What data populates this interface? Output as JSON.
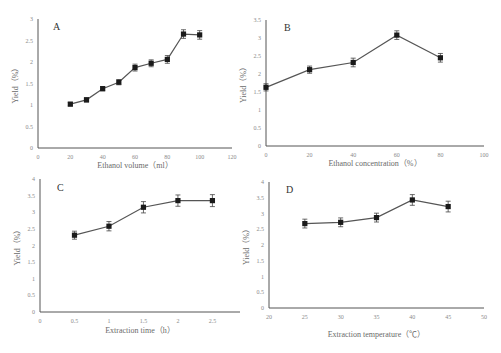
{
  "chart_data": [
    {
      "panel": "A",
      "type": "line",
      "title": "",
      "xlabel": "Ethanol volume（ml）",
      "ylabel": "Yield（%）",
      "x": [
        20,
        30,
        40,
        50,
        60,
        70,
        80,
        90,
        100
      ],
      "values": [
        1.02,
        1.12,
        1.38,
        1.53,
        1.87,
        1.97,
        2.06,
        2.65,
        2.63
      ],
      "errors": [
        0.04,
        0.05,
        0.05,
        0.06,
        0.08,
        0.08,
        0.09,
        0.1,
        0.1
      ],
      "xlim": [
        0,
        120
      ],
      "xticks": [
        0,
        20,
        40,
        60,
        80,
        100,
        120
      ],
      "ylim": [
        0,
        3
      ],
      "yticks": [
        0,
        0.5,
        1,
        1.5,
        2,
        2.5,
        3
      ],
      "grid": false,
      "legend": "none"
    },
    {
      "panel": "B",
      "type": "line",
      "title": "",
      "xlabel": "Ethanol concentration（%）",
      "ylabel": "Yield（%）",
      "x": [
        0,
        20,
        40,
        60,
        80
      ],
      "values": [
        1.63,
        2.12,
        2.32,
        3.08,
        2.45
      ],
      "errors": [
        0.1,
        0.1,
        0.12,
        0.12,
        0.12
      ],
      "xlim": [
        0,
        100
      ],
      "xticks": [
        0,
        20,
        40,
        60,
        80,
        100
      ],
      "ylim": [
        0,
        3.5
      ],
      "yticks": [
        0,
        0.5,
        1,
        1.5,
        2,
        2.5,
        3,
        3.5
      ],
      "grid": false,
      "legend": "none"
    },
    {
      "panel": "C",
      "type": "line",
      "title": "",
      "xlabel": "Extraction time（h）",
      "ylabel": "Yield（%）",
      "x": [
        0.5,
        1,
        1.5,
        2,
        2.5
      ],
      "values": [
        2.31,
        2.58,
        3.15,
        3.35,
        3.35
      ],
      "errors": [
        0.12,
        0.14,
        0.17,
        0.17,
        0.18
      ],
      "xlim": [
        0,
        2.9
      ],
      "xticks": [
        0,
        0.5,
        1,
        1.5,
        2,
        2.5
      ],
      "ylim": [
        0,
        4
      ],
      "yticks": [
        0,
        0.5,
        1,
        1.5,
        2,
        2.5,
        3,
        3.5,
        4
      ],
      "grid": false,
      "legend": "none"
    },
    {
      "panel": "D",
      "type": "line",
      "title": "",
      "xlabel": "Extraction temperature（℃）",
      "ylabel": "Yield（%）",
      "x": [
        25,
        30,
        35,
        40,
        45
      ],
      "values": [
        2.68,
        2.72,
        2.87,
        3.43,
        3.22
      ],
      "errors": [
        0.14,
        0.14,
        0.14,
        0.17,
        0.17
      ],
      "xlim": [
        20,
        50
      ],
      "xticks": [
        20,
        25,
        30,
        35,
        40,
        45,
        50
      ],
      "ylim": [
        0,
        4
      ],
      "yticks": [
        0,
        0.5,
        1,
        1.5,
        2,
        2.5,
        3,
        3.5,
        4
      ],
      "grid": false,
      "legend": "none"
    }
  ],
  "layout": [
    {
      "left": 38,
      "right": 232,
      "top": 19,
      "bottom": 148,
      "labelX": 53,
      "labelY": 30,
      "xlabelY": 168
    },
    {
      "left": 266,
      "right": 484,
      "top": 20,
      "bottom": 146,
      "labelX": 284,
      "labelY": 31,
      "xlabelY": 166
    },
    {
      "left": 40,
      "right": 240,
      "top": 179,
      "bottom": 312,
      "labelX": 57,
      "labelY": 191,
      "xlabelY": 333
    },
    {
      "left": 269,
      "right": 484,
      "top": 182,
      "bottom": 308,
      "labelX": 286,
      "labelY": 193,
      "xlabelY": 337
    }
  ],
  "colors": {
    "line": "#555555",
    "marker": "#1a1a1a",
    "axis": "#555555",
    "error": "#444444"
  }
}
